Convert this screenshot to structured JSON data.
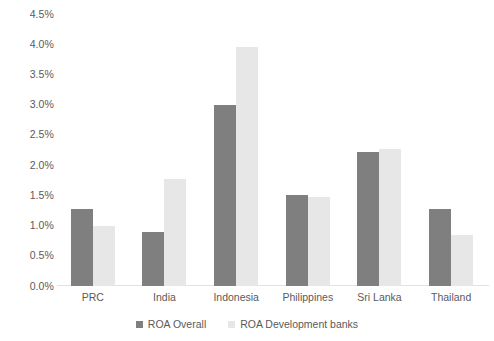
{
  "chart_data": {
    "type": "bar",
    "title": "",
    "subtitle": "",
    "xlabel": "",
    "ylabel": "",
    "categories": [
      "PRC",
      "India",
      "Indonesia",
      "Philippines",
      "Sri Lanka",
      "Thailand"
    ],
    "series": [
      {
        "name": "ROA Overall",
        "color": "#7f7f7f",
        "values": [
          1.27,
          0.89,
          2.99,
          1.5,
          2.21,
          1.28
        ]
      },
      {
        "name": "ROA Development banks",
        "color": "#e7e7e7",
        "values": [
          0.99,
          1.77,
          3.95,
          1.48,
          2.26,
          0.84
        ]
      }
    ],
    "ylim": [
      0,
      4.5
    ],
    "ytick_values": [
      0,
      0.5,
      1,
      1.5,
      2,
      2.5,
      3,
      3.5,
      4,
      4.5
    ],
    "ytick_labels": [
      "0.0%",
      "0.5%",
      "1.0%",
      "1.5%",
      "2.0%",
      "2.5%",
      "3.0%",
      "3.5%",
      "4.0%",
      "4.5%"
    ],
    "value_unit": "percent",
    "grid": false,
    "legend_position": "bottom",
    "axis_line_color": "#e2e2e2",
    "text_color": "#5a5a5a",
    "background_color": "#ffffff"
  },
  "legend": {
    "items": [
      {
        "label": "ROA Overall",
        "color": "#7f7f7f"
      },
      {
        "label": "ROA Development banks",
        "color": "#e7e7e7"
      }
    ]
  }
}
